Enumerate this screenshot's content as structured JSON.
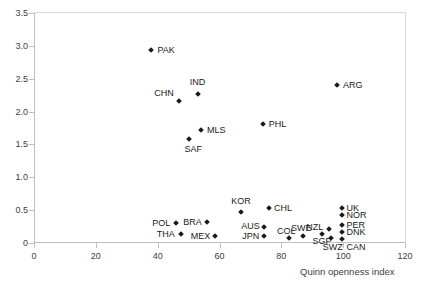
{
  "chart_data": {
    "type": "scatter",
    "title": "",
    "xlabel": "Quinn openness index",
    "ylabel": "",
    "xlim": [
      0,
      120
    ],
    "ylim": [
      0,
      3.5
    ],
    "xticks": [
      "0",
      "20",
      "40",
      "60",
      "80",
      "100",
      "120"
    ],
    "yticks": [
      "0",
      "0.5",
      "1.0",
      "1.5",
      "2.0",
      "2.5",
      "3.0",
      "3.5"
    ],
    "grid": false,
    "legend": "none",
    "marker": "diamond",
    "marker_color": "#1a1a1a",
    "axis_color": "#bfbfbf",
    "points": [
      {
        "label": "PAK",
        "x": 38.0,
        "y": 2.93,
        "lx": 6,
        "ly": -4
      },
      {
        "label": "CHN",
        "x": 47.0,
        "y": 2.16,
        "lx": -25,
        "ly": -12
      },
      {
        "label": "IND",
        "x": 53.0,
        "y": 2.26,
        "lx": -8,
        "ly": -16
      },
      {
        "label": "MLS",
        "x": 54.0,
        "y": 1.72,
        "lx": 6,
        "ly": -4
      },
      {
        "label": "SAF",
        "x": 50.0,
        "y": 1.58,
        "lx": -4,
        "ly": 6
      },
      {
        "label": "PHL",
        "x": 74.0,
        "y": 1.81,
        "lx": 6,
        "ly": -4
      },
      {
        "label": "ARG",
        "x": 98.0,
        "y": 2.41,
        "lx": 6,
        "ly": -4
      },
      {
        "label": "POL",
        "x": 46.0,
        "y": 0.3,
        "lx": -24,
        "ly": -4
      },
      {
        "label": "THA",
        "x": 47.5,
        "y": 0.13,
        "lx": -24,
        "ly": -4
      },
      {
        "label": "BRA",
        "x": 56.0,
        "y": 0.32,
        "lx": -24,
        "ly": -4
      },
      {
        "label": "MEX",
        "x": 58.5,
        "y": 0.11,
        "lx": -24,
        "ly": -4
      },
      {
        "label": "KOR",
        "x": 67.0,
        "y": 0.47,
        "lx": -10,
        "ly": -15
      },
      {
        "label": "CHL",
        "x": 76.0,
        "y": 0.54,
        "lx": 5,
        "ly": -4
      },
      {
        "label": "AUS",
        "x": 74.5,
        "y": 0.25,
        "lx": -23,
        "ly": -5
      },
      {
        "label": "JPN",
        "x": 74.5,
        "y": 0.11,
        "lx": -22,
        "ly": -4
      },
      {
        "label": "COL",
        "x": 82.5,
        "y": 0.08,
        "lx": -12,
        "ly": -11
      },
      {
        "label": "SWE",
        "x": 87.0,
        "y": 0.1,
        "lx": -12,
        "ly": -12
      },
      {
        "label": "SGP",
        "x": 93.0,
        "y": 0.14,
        "lx": -9,
        "ly": 3
      },
      {
        "label": "NZL",
        "x": 95.5,
        "y": 0.22,
        "lx": -23,
        "ly": -6
      },
      {
        "label": "SWZ",
        "x": 96.0,
        "y": 0.08,
        "lx": -8,
        "ly": 5
      },
      {
        "label": "UK",
        "x": 99.5,
        "y": 0.54,
        "lx": 5,
        "ly": -4
      },
      {
        "label": "NOR",
        "x": 99.5,
        "y": 0.42,
        "lx": 5,
        "ly": -4
      },
      {
        "label": "PER",
        "x": 99.5,
        "y": 0.28,
        "lx": 5,
        "ly": -4
      },
      {
        "label": "DNK",
        "x": 99.5,
        "y": 0.17,
        "lx": 5,
        "ly": -4
      },
      {
        "label": "CAN",
        "x": 99.5,
        "y": 0.06,
        "lx": 5,
        "ly": 4
      }
    ]
  }
}
